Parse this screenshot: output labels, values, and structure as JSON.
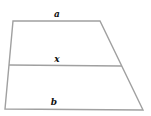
{
  "diagram": {
    "type": "trapezoid",
    "stroke_color": "#a0a0a0",
    "label_color": "#111111",
    "vertices": {
      "top_left": [
        13,
        21
      ],
      "top_right": [
        100,
        21
      ],
      "bottom_right": [
        143,
        110
      ],
      "bottom_left": [
        5,
        109
      ]
    },
    "middle_segment": {
      "left": [
        9,
        65
      ],
      "right": [
        122,
        66
      ]
    },
    "labels": {
      "top": {
        "text": "a",
        "x": 57,
        "y": 14
      },
      "middle": {
        "text": "x",
        "x": 57,
        "y": 59
      },
      "bottom": {
        "text": "b",
        "x": 54,
        "y": 102
      }
    }
  }
}
